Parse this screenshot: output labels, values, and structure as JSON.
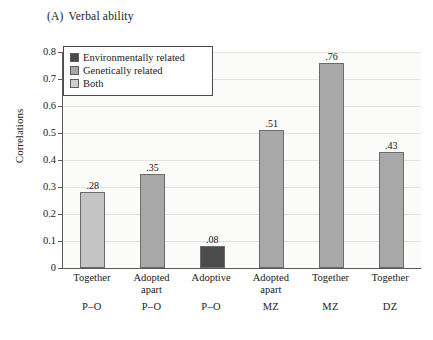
{
  "figure": {
    "panel_tag": "(A)",
    "panel_title": "Verbal ability"
  },
  "chart_data": {
    "type": "bar",
    "xlabel": "",
    "ylabel": "Correlations",
    "ylim": [
      0,
      0.8
    ],
    "ytick_labels": [
      "0",
      "0.1",
      "0.2",
      "0.3",
      "0.4",
      "0.5",
      "0.6",
      "0.7",
      "0.8"
    ],
    "ytick_values": [
      0,
      0.1,
      0.2,
      0.3,
      0.4,
      0.5,
      0.6,
      0.7,
      0.8
    ],
    "grid": true,
    "legend_position": "upper left (inside axes)",
    "categories": [
      "Together P-O",
      "Adopted apart P-O",
      "Adoptive P-O",
      "Adopted apart MZ",
      "Together MZ",
      "Together DZ"
    ],
    "values": [
      0.28,
      0.35,
      0.08,
      0.51,
      0.76,
      0.43
    ],
    "value_labels": [
      ".28",
      ".35",
      ".08",
      ".51",
      ".76",
      ".43"
    ],
    "bar_groups": [
      "Both",
      "Genetically related",
      "Environmentally related",
      "Genetically related",
      "Genetically related",
      "Genetically related"
    ],
    "series": [
      {
        "name": "Environmentally related",
        "color": "#4b4b4b",
        "values": [
          null,
          null,
          0.08,
          null,
          null,
          null
        ]
      },
      {
        "name": "Genetically related",
        "color": "#a8a8a8",
        "values": [
          null,
          0.35,
          null,
          0.51,
          0.76,
          0.43
        ]
      },
      {
        "name": "Both",
        "color": "#c4c4c4",
        "values": [
          0.28,
          null,
          null,
          null,
          null,
          null
        ]
      }
    ]
  },
  "legend": {
    "items": [
      {
        "label": "Environmentally related",
        "color": "#4b4b4b"
      },
      {
        "label": "Genetically related",
        "color": "#a8a8a8"
      },
      {
        "label": "Both",
        "color": "#cfcfcf"
      }
    ]
  },
  "yaxis": {
    "label": "Correlations",
    "ticks": [
      {
        "label": "0.8",
        "value": 0.8
      },
      {
        "label": "0.7",
        "value": 0.7
      },
      {
        "label": "0.6",
        "value": 0.6
      },
      {
        "label": "0.5",
        "value": 0.5
      },
      {
        "label": "0.4",
        "value": 0.4
      },
      {
        "label": "0.3",
        "value": 0.3
      },
      {
        "label": "0.2",
        "value": 0.2
      },
      {
        "label": "0.1",
        "value": 0.1
      },
      {
        "label": "0",
        "value": 0
      }
    ]
  },
  "xaxis": {
    "groups": [
      {
        "line1": "Together",
        "line2": "P–O"
      },
      {
        "line1": "Adopted\napart",
        "line2": "P–O"
      },
      {
        "line1": "Adoptive",
        "line2": "P–O"
      },
      {
        "line1": "Adopted\napart",
        "line2": "MZ"
      },
      {
        "line1": "Together",
        "line2": "MZ"
      },
      {
        "line1": "Together",
        "line2": "DZ"
      }
    ]
  },
  "bars": [
    {
      "label": ".28",
      "value": 0.28,
      "color": "#c4c4c4",
      "group": "Both"
    },
    {
      "label": ".35",
      "value": 0.35,
      "color": "#a8a8a8",
      "group": "Genetically related"
    },
    {
      "label": ".08",
      "value": 0.08,
      "color": "#4b4b4b",
      "group": "Environmentally related"
    },
    {
      "label": ".51",
      "value": 0.51,
      "color": "#a8a8a8",
      "group": "Genetically related"
    },
    {
      "label": ".76",
      "value": 0.76,
      "color": "#a8a8a8",
      "group": "Genetically related"
    },
    {
      "label": ".43",
      "value": 0.43,
      "color": "#a8a8a8",
      "group": "Genetically related"
    }
  ]
}
